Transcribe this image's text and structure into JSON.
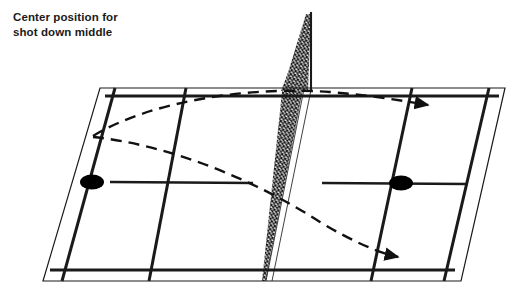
{
  "caption": {
    "line1": "Center position for",
    "line2": "shot down middle"
  },
  "diagram": {
    "colors": {
      "line": "#1a1a1a",
      "thin_line": "#333333",
      "marker": "#000000",
      "net_hatch": "#1a1a1a",
      "background": "#ffffff"
    },
    "court": {
      "outer_corners": [
        {
          "x": 100,
          "y": 88
        },
        {
          "x": 505,
          "y": 88
        },
        {
          "x": 461,
          "y": 281
        },
        {
          "x": 43,
          "y": 281
        }
      ],
      "singles_sideline_top": [
        {
          "x": 107,
          "y": 96
        },
        {
          "x": 496,
          "y": 96
        }
      ],
      "singles_sideline_bottom": [
        {
          "x": 53,
          "y": 271
        },
        {
          "x": 452,
          "y": 271
        }
      ],
      "net_line": [
        {
          "x": 303,
          "y": 88
        },
        {
          "x": 266,
          "y": 281
        }
      ],
      "net_post": {
        "x": 311,
        "y_top": 12,
        "y_base": 90
      },
      "net_peak": {
        "x": 311,
        "y": 12
      }
    },
    "markers": [
      {
        "name": "player-marker-left",
        "x": 92,
        "y": 182,
        "rx": 12,
        "ry": 7.5
      },
      {
        "name": "player-marker-right",
        "x": 401,
        "y": 183,
        "rx": 12,
        "ry": 7.5
      }
    ],
    "trajectories": [
      {
        "name": "shot-path-upper",
        "origin": {
          "x": 93,
          "y": 136
        },
        "arrow_tip": {
          "x": 434,
          "y": 105
        },
        "style": "dashed",
        "description": "high arcing shot crossing net to far right side"
      },
      {
        "name": "shot-path-lower",
        "origin": {
          "x": 93,
          "y": 137
        },
        "arrow_tip": {
          "x": 404,
          "y": 259
        },
        "style": "dashed",
        "description": "flatter shot crossing net toward near baseline right"
      }
    ]
  }
}
